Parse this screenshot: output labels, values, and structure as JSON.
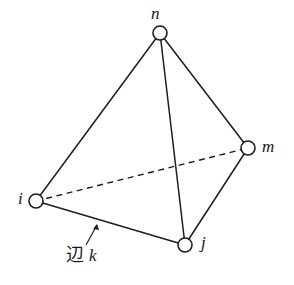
{
  "figure": {
    "name": "tetrahedron-element-diagram",
    "width": 294,
    "height": 285,
    "background_color": "#ffffff",
    "line_color": "#1d1d20",
    "node_fill_color": "#ffffff"
  },
  "nodes": [
    {
      "id": "n",
      "label": "n",
      "cx": 160,
      "cy": 33,
      "r": 7,
      "label_x": 151,
      "label_y": 5
    },
    {
      "id": "m",
      "label": "m",
      "cx": 248,
      "cy": 148,
      "r": 7,
      "label_x": 262,
      "label_y": 138
    },
    {
      "id": "i",
      "label": "i",
      "cx": 36,
      "cy": 201,
      "r": 7,
      "label_x": 18,
      "label_y": 190
    },
    {
      "id": "j",
      "label": "j",
      "cx": 185,
      "cy": 245,
      "r": 7,
      "label_x": 201,
      "label_y": 234
    }
  ],
  "edges": [
    {
      "id": "n-i",
      "from": "n",
      "to": "i",
      "style": "solid",
      "hidden": false
    },
    {
      "id": "n-m",
      "from": "n",
      "to": "m",
      "style": "solid",
      "hidden": false
    },
    {
      "id": "n-j",
      "from": "n",
      "to": "j",
      "style": "solid",
      "hidden": false
    },
    {
      "id": "i-j",
      "from": "i",
      "to": "j",
      "style": "solid",
      "hidden": false
    },
    {
      "id": "j-m",
      "from": "j",
      "to": "m",
      "style": "solid",
      "hidden": false
    },
    {
      "id": "i-m",
      "from": "i",
      "to": "m",
      "style": "dashed",
      "hidden": true
    }
  ],
  "annotation": {
    "edge_word": "辺",
    "edge_id": "k",
    "full_text": "辺 k",
    "target_edge": "i-j",
    "label_x": 66,
    "label_y": 246,
    "leader_from_x": 86,
    "leader_from_y": 245,
    "leader_to_x": 97,
    "leader_to_y": 224
  }
}
